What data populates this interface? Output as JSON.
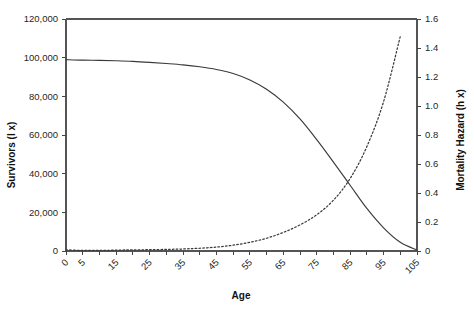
{
  "chart_data": {
    "type": "line",
    "title": "",
    "xlabel": "Age",
    "ylabel": "Survivors (l x)",
    "ylabel_right": "Mortality Hazard (h x)",
    "xlim": [
      0,
      105
    ],
    "ylim": [
      0,
      120000
    ],
    "ylim_right": [
      0,
      1.6
    ],
    "grid": false,
    "legend": "none",
    "x_tick_step": 5,
    "x_tick_labels": [
      "0",
      "5",
      "15",
      "25",
      "35",
      "45",
      "55",
      "65",
      "75",
      "85",
      "95",
      "105"
    ],
    "x_tick_label_values": [
      0,
      5,
      15,
      25,
      35,
      45,
      55,
      65,
      75,
      85,
      95,
      105
    ],
    "x_tick_values": [
      0,
      5,
      10,
      15,
      20,
      25,
      30,
      35,
      40,
      45,
      50,
      55,
      60,
      65,
      70,
      75,
      80,
      85,
      90,
      95,
      100,
      105
    ],
    "y_tick_labels": [
      "0",
      "20,000",
      "40,000",
      "60,000",
      "80,000",
      "100,000",
      "120,000"
    ],
    "y_tick_values": [
      0,
      20000,
      40000,
      60000,
      80000,
      100000,
      120000
    ],
    "y_right_tick_labels": [
      "0",
      "0.2",
      "0.4",
      "0.6",
      "0.8",
      "1.0",
      "1.2",
      "1.4",
      "1.6"
    ],
    "y_right_tick_values": [
      0,
      0.2,
      0.4,
      0.6,
      0.8,
      1.0,
      1.2,
      1.4,
      1.6
    ],
    "x": [
      0,
      5,
      10,
      15,
      20,
      25,
      30,
      35,
      40,
      45,
      50,
      55,
      60,
      65,
      70,
      75,
      80,
      85,
      90,
      95,
      100,
      105
    ],
    "series": [
      {
        "name": "Survivors (l x)",
        "axis": "left",
        "style": "solid",
        "color": "#3a3a3a",
        "values": [
          99000,
          98700,
          98600,
          98400,
          98100,
          97600,
          97000,
          96300,
          95300,
          93900,
          91800,
          88500,
          83700,
          77000,
          68300,
          57600,
          46000,
          34000,
          22000,
          12000,
          4500,
          500
        ]
      },
      {
        "name": "Mortality Hazard (h x)",
        "axis": "right",
        "style": "dotted",
        "color": "#3a3a3a",
        "values": [
          0.008,
          0.004,
          0.004,
          0.006,
          0.008,
          0.009,
          0.011,
          0.014,
          0.019,
          0.027,
          0.04,
          0.06,
          0.088,
          0.128,
          0.18,
          0.25,
          0.35,
          0.5,
          0.72,
          1.03,
          1.48,
          1.5
        ]
      }
    ],
    "annotations": [
      "Survivor curve begins near 99,000 at age 0 and declines toward 0 by age 105",
      "Mortality hazard is near zero until about age 50 then rises steeply, reaching about 1.5 near age 100",
      "The two curves cross at about age 85 (≈37,000 survivors, hazard ≈0.5)"
    ],
    "colors": {
      "axis": "#555555",
      "tick": "#444444",
      "text": "#1f1f1f",
      "series": "#3a3a3a",
      "background": "#ffffff"
    }
  },
  "layout": {
    "plot_left": 66,
    "plot_right": 417,
    "plot_top": 19,
    "plot_bottom": 251
  }
}
